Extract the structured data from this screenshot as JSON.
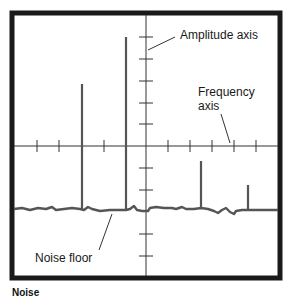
{
  "labels": {
    "amplitude_axis": "Amplitude axis",
    "frequency_axis_line1": "Frequency",
    "frequency_axis_line2": "axis",
    "noise_floor": "Noise floor",
    "caption_partial": "Noise"
  },
  "colors": {
    "frame": "#1a1a1a",
    "axis": "#333333",
    "trace": "#555555",
    "background": "#ffffff"
  },
  "diagram": {
    "frame": {
      "x": 12,
      "y": 13,
      "width": 268,
      "height": 265
    },
    "origin": {
      "x": 146,
      "y": 146
    },
    "horizontal_ticks_x": [
      37,
      59,
      82,
      104,
      126,
      168,
      190,
      212,
      234,
      256
    ],
    "vertical_ticks_y": [
      37,
      59,
      81,
      103,
      124,
      168,
      190,
      234,
      256
    ],
    "noise_floor_y": 209,
    "spikes": [
      {
        "x": 82,
        "top": 84
      },
      {
        "x": 126,
        "top": 37
      },
      {
        "x": 201,
        "top": 161
      },
      {
        "x": 248,
        "top": 185
      }
    ]
  }
}
